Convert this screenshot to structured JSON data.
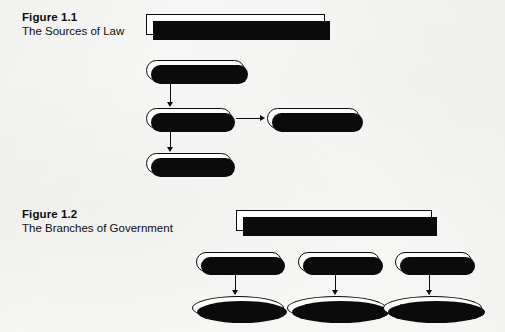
{
  "page": {
    "background_color": "#f6f6f4",
    "ink_color": "#0b0b0b",
    "node_fill": "#fdfdfc"
  },
  "figures": [
    {
      "caption_number": "Figure 1.1",
      "caption_title": "The Sources of Law",
      "banner": "Sources of Law",
      "nodes": [
        {
          "label": "Constitution",
          "shape": "pill"
        },
        {
          "label": "Statutes",
          "shape": "pill"
        },
        {
          "label": "Regulations",
          "shape": "pill"
        },
        {
          "label": "Cases",
          "shape": "pill"
        }
      ],
      "connections": [
        {
          "from": "Constitution",
          "to": "Statutes",
          "direction": "down"
        },
        {
          "from": "Statutes",
          "to": "Regulations",
          "direction": "right"
        },
        {
          "from": "Statutes",
          "to": "Cases",
          "direction": "down"
        }
      ]
    },
    {
      "caption_number": "Figure 1.2",
      "caption_title": "The Branches of Government",
      "banner": "Branches of Government",
      "nodes": [
        {
          "label": "Legislative",
          "shape": "pill"
        },
        {
          "label": "Executive",
          "shape": "pill"
        },
        {
          "label": "Judicial",
          "shape": "pill"
        },
        {
          "label": "Creates Law",
          "shape": "ellipse"
        },
        {
          "label": "Enforces Law",
          "shape": "ellipse"
        },
        {
          "label": "Interprets Law",
          "shape": "ellipse"
        }
      ],
      "connections": [
        {
          "from": "Legislative",
          "to": "Creates Law",
          "direction": "down"
        },
        {
          "from": "Executive",
          "to": "Enforces Law",
          "direction": "down"
        },
        {
          "from": "Judicial",
          "to": "Interprets Law",
          "direction": "down"
        }
      ]
    }
  ]
}
